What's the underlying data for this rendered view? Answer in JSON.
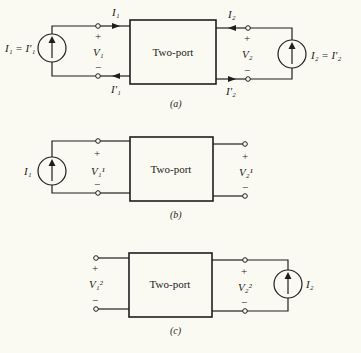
{
  "figure": {
    "background": "#fbfaf2",
    "ink": "#1e1e1e",
    "block_label": "Two-port",
    "panels": [
      {
        "id": "a",
        "caption": "(a)",
        "left_source": "I₁ = I′₁",
        "right_source": "I₂ = I′₂",
        "port1": {
          "current_in": "I₁",
          "current_out": "I′₁",
          "voltage": "V₁",
          "plus": "+",
          "minus": "−"
        },
        "port2": {
          "current_in": "I₂",
          "current_out": "I′₂",
          "voltage": "V₂",
          "plus": "+",
          "minus": "−"
        }
      },
      {
        "id": "b",
        "caption": "(b)",
        "left_source": "I₁",
        "port1": {
          "voltage": "V₁¹",
          "plus": "+",
          "minus": "−"
        },
        "port2": {
          "voltage": "V₂¹",
          "plus": "+",
          "minus": "−"
        }
      },
      {
        "id": "c",
        "caption": "(c)",
        "right_source": "I₂",
        "port1": {
          "voltage": "V₁²",
          "plus": "+",
          "minus": "−"
        },
        "port2": {
          "voltage": "V₂²",
          "plus": "+",
          "minus": "−"
        }
      }
    ]
  }
}
